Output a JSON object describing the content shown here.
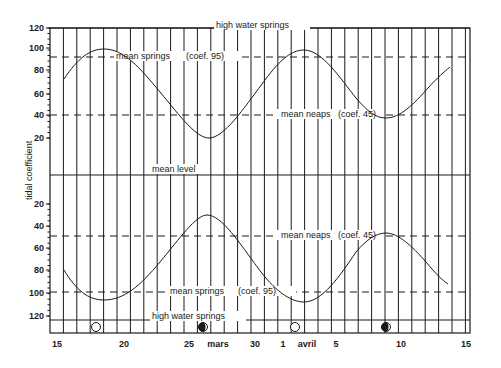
{
  "chart_data": {
    "type": "line",
    "title": "",
    "ylabel": "tidal coefficient",
    "xlabel": "",
    "grid": true,
    "x_ticks": [
      {
        "label": "15",
        "day": 0
      },
      {
        "label": "20",
        "day": 5
      },
      {
        "label": "25",
        "day": 10
      },
      {
        "label": "mars",
        "day": 12
      },
      {
        "label": "30",
        "day": 15
      },
      {
        "label": "1",
        "day": 17
      },
      {
        "label": "avril",
        "day": 19
      },
      {
        "label": "5",
        "day": 21
      },
      {
        "label": "10",
        "day": 26
      },
      {
        "label": "15",
        "day": 31
      }
    ],
    "y_ticks_upper": [
      "120",
      "100",
      "80",
      "60",
      "40",
      "20"
    ],
    "y_ticks_lower": [
      "20",
      "40",
      "60",
      "80",
      "100",
      "120"
    ],
    "reference_lines": [
      {
        "name": "high water springs",
        "label": "high water springs",
        "coef": 120,
        "style": "solid",
        "panel": "upper"
      },
      {
        "name": "mean springs",
        "label": "mean springs",
        "coef_label": "(coef. 95)",
        "coef": 95,
        "style": "dashed",
        "panel": "upper"
      },
      {
        "name": "mean neaps",
        "label": "mean neaps",
        "coef_label": "(coef. 45)",
        "coef": 45,
        "style": "dashed",
        "panel": "upper"
      },
      {
        "name": "mean level",
        "label": "mean level",
        "coef": 0,
        "style": "solid",
        "panel": "center"
      },
      {
        "name": "mean neaps",
        "label": "mean neaps",
        "coef_label": "(coef. 45)",
        "coef": 45,
        "style": "dashed",
        "panel": "lower"
      },
      {
        "name": "mean springs",
        "label": "mean springs",
        "coef_label": "(coef. 95)",
        "coef": 95,
        "style": "dashed",
        "panel": "lower"
      },
      {
        "name": "high water springs",
        "label": "high water springs",
        "coef": 120,
        "style": "solid",
        "panel": "lower"
      }
    ],
    "series": [
      {
        "name": "tidal coefficient (upper)",
        "x_day": [
          1,
          4,
          7,
          10.5,
          14,
          18.5,
          23.5,
          28.5
        ],
        "values": [
          75,
          100,
          75,
          20,
          75,
          100,
          37,
          85
        ]
      },
      {
        "name": "tidal coefficient (lower, mirrored)",
        "x_day": [
          1,
          4,
          7,
          10.5,
          14,
          18.5,
          23.5,
          28.5
        ],
        "values": [
          75,
          105,
          75,
          25,
          75,
          105,
          40,
          90
        ]
      }
    ],
    "moon_phases": [
      {
        "phase": "full moon",
        "icon": "open-circle",
        "day": 3.5
      },
      {
        "phase": "quarter moon",
        "icon": "half-filled-circle",
        "day": 11
      },
      {
        "phase": "full moon",
        "icon": "open-circle",
        "day": 18
      },
      {
        "phase": "quarter moon",
        "icon": "half-filled-circle",
        "day": 25.5
      }
    ],
    "colors": {
      "ink": "#1a1a1a",
      "background": "#ffffff"
    }
  }
}
